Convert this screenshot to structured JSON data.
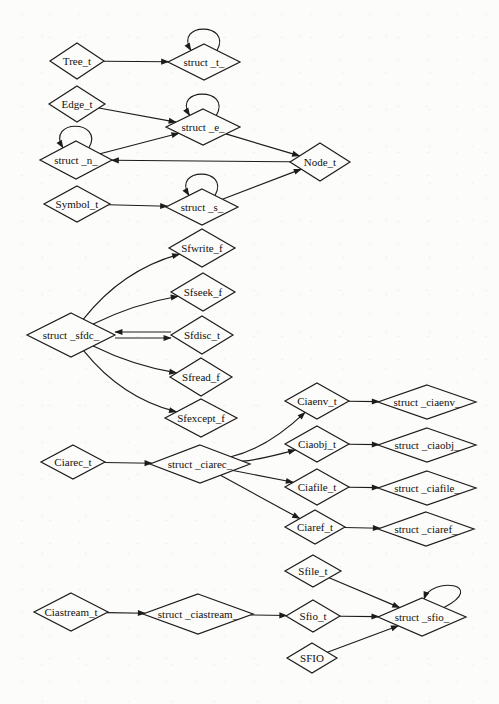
{
  "diagram": {
    "kind": "type-dependency-graph",
    "colors": {
      "stroke": "#1d1c1a",
      "text": "#12110f",
      "node_fill": "#fcfcfa",
      "background": "#fcfcfa"
    },
    "nodes": [
      {
        "id": "tree_t",
        "label": "Tree_t",
        "x": 77,
        "y": 61,
        "hw": 27,
        "hh": 18,
        "loop": ""
      },
      {
        "id": "struct_t",
        "label": "struct _t_",
        "x": 204,
        "y": 62,
        "hw": 36,
        "hh": 18,
        "loop": "top"
      },
      {
        "id": "edge_t",
        "label": "Edge_t",
        "x": 77,
        "y": 104,
        "hw": 28,
        "hh": 18,
        "loop": ""
      },
      {
        "id": "struct_e",
        "label": "struct _e_",
        "x": 203,
        "y": 127,
        "hw": 37,
        "hh": 18,
        "loop": "top"
      },
      {
        "id": "struct_n",
        "label": "struct _n_",
        "x": 76,
        "y": 160,
        "hw": 36,
        "hh": 19,
        "loop": "top"
      },
      {
        "id": "node_t",
        "label": "Node_t",
        "x": 320,
        "y": 162,
        "hw": 30,
        "hh": 19,
        "loop": ""
      },
      {
        "id": "symbol_t",
        "label": "Symbol_t",
        "x": 77,
        "y": 204,
        "hw": 33,
        "hh": 18,
        "loop": ""
      },
      {
        "id": "struct_s",
        "label": "struct _s_",
        "x": 202,
        "y": 207,
        "hw": 36,
        "hh": 18,
        "loop": "top"
      },
      {
        "id": "struct_sfdc",
        "label": "struct _sfdc_",
        "x": 71,
        "y": 335,
        "hw": 44,
        "hh": 22,
        "loop": ""
      },
      {
        "id": "sfwrite_f",
        "label": "Sfwrite_f",
        "x": 202,
        "y": 248,
        "hw": 33,
        "hh": 19,
        "loop": ""
      },
      {
        "id": "sfseek_f",
        "label": "Sfseek_f",
        "x": 203,
        "y": 292,
        "hw": 32,
        "hh": 19,
        "loop": ""
      },
      {
        "id": "sfdisc_t",
        "label": "Sfdisc_t",
        "x": 202,
        "y": 335,
        "hw": 31,
        "hh": 19,
        "loop": ""
      },
      {
        "id": "sfread_f",
        "label": "Sfread_f",
        "x": 201,
        "y": 377,
        "hw": 31,
        "hh": 19,
        "loop": ""
      },
      {
        "id": "sfexcept_f",
        "label": "Sfexcept_f",
        "x": 201,
        "y": 418,
        "hw": 36,
        "hh": 19,
        "loop": ""
      },
      {
        "id": "ciarec_t",
        "label": "Ciarec_t",
        "x": 73,
        "y": 462,
        "hw": 32,
        "hh": 17,
        "loop": ""
      },
      {
        "id": "struct_ciarec",
        "label": "struct _ciarec_",
        "x": 200,
        "y": 464,
        "hw": 50,
        "hh": 19,
        "loop": ""
      },
      {
        "id": "ciaenv_t",
        "label": "Ciaenv_t",
        "x": 317,
        "y": 401,
        "hw": 32,
        "hh": 18,
        "loop": ""
      },
      {
        "id": "struct_ciaenv",
        "label": "struct _ciaenv_",
        "x": 427,
        "y": 402,
        "hw": 49,
        "hh": 17,
        "loop": ""
      },
      {
        "id": "ciaobj_t",
        "label": "Ciaobj_t",
        "x": 317,
        "y": 444,
        "hw": 32,
        "hh": 18,
        "loop": ""
      },
      {
        "id": "struct_ciaobj",
        "label": "struct _ciaobj_",
        "x": 427,
        "y": 445,
        "hw": 49,
        "hh": 17,
        "loop": ""
      },
      {
        "id": "ciafile_t",
        "label": "Ciafile_t",
        "x": 317,
        "y": 487,
        "hw": 32,
        "hh": 18,
        "loop": ""
      },
      {
        "id": "struct_ciafile",
        "label": "struct _ciafile_",
        "x": 427,
        "y": 488,
        "hw": 49,
        "hh": 17,
        "loop": ""
      },
      {
        "id": "ciaref_t",
        "label": "Ciaref_t",
        "x": 315,
        "y": 527,
        "hw": 30,
        "hh": 17,
        "loop": ""
      },
      {
        "id": "struct_ciaref",
        "label": "struct _ciaref_",
        "x": 426,
        "y": 529,
        "hw": 48,
        "hh": 17,
        "loop": ""
      },
      {
        "id": "ciastream_t",
        "label": "Ciastream_t",
        "x": 71,
        "y": 612,
        "hw": 37,
        "hh": 19,
        "loop": ""
      },
      {
        "id": "struct_ciastream",
        "label": "struct _ciastream_",
        "x": 198,
        "y": 614,
        "hw": 55,
        "hh": 20,
        "loop": ""
      },
      {
        "id": "sfile_t",
        "label": "Sfile_t",
        "x": 313,
        "y": 571,
        "hw": 28,
        "hh": 16,
        "loop": ""
      },
      {
        "id": "sfio_t",
        "label": "Sfio_t",
        "x": 313,
        "y": 616,
        "hw": 27,
        "hh": 16,
        "loop": ""
      },
      {
        "id": "sfio",
        "label": "SFIO",
        "x": 312,
        "y": 658,
        "hw": 25,
        "hh": 15,
        "loop": ""
      },
      {
        "id": "struct_sfio",
        "label": "struct _sfio_",
        "x": 422,
        "y": 617,
        "hw": 44,
        "hh": 19,
        "loop": "topright"
      }
    ],
    "edges": [
      {
        "from": "tree_t",
        "to": "struct_t",
        "bend": 0,
        "shift_y": 0
      },
      {
        "from": "edge_t",
        "to": "struct_e",
        "bend": 0,
        "shift_y": 0
      },
      {
        "from": "struct_n",
        "to": "struct_e",
        "bend": 0,
        "shift_y": 0
      },
      {
        "from": "struct_e",
        "to": "node_t",
        "bend": 0,
        "shift_y": 0
      },
      {
        "from": "node_t",
        "to": "struct_n",
        "bend": 0,
        "shift_y": 0
      },
      {
        "from": "symbol_t",
        "to": "struct_s",
        "bend": 0,
        "shift_y": 0
      },
      {
        "from": "struct_s",
        "to": "node_t",
        "bend": 0,
        "shift_y": 0
      },
      {
        "from": "struct_sfdc",
        "to": "sfwrite_f",
        "bend": -26,
        "shift_y": 0
      },
      {
        "from": "struct_sfdc",
        "to": "sfseek_f",
        "bend": -10,
        "shift_y": 0
      },
      {
        "from": "struct_sfdc",
        "to": "sfdisc_t",
        "bend": 0,
        "shift_y": 3
      },
      {
        "from": "sfdisc_t",
        "to": "struct_sfdc",
        "bend": 0,
        "shift_y": -3
      },
      {
        "from": "struct_sfdc",
        "to": "sfread_f",
        "bend": 10,
        "shift_y": 0
      },
      {
        "from": "struct_sfdc",
        "to": "sfexcept_f",
        "bend": 26,
        "shift_y": 0
      },
      {
        "from": "ciarec_t",
        "to": "struct_ciarec",
        "bend": 0,
        "shift_y": 0
      },
      {
        "from": "struct_ciarec",
        "to": "ciaenv_t",
        "bend": 18,
        "shift_y": 0
      },
      {
        "from": "struct_ciarec",
        "to": "ciaobj_t",
        "bend": 6,
        "shift_y": 0
      },
      {
        "from": "struct_ciarec",
        "to": "ciafile_t",
        "bend": 0,
        "shift_y": 0
      },
      {
        "from": "struct_ciarec",
        "to": "ciaref_t",
        "bend": 0,
        "shift_y": 0
      },
      {
        "from": "ciaenv_t",
        "to": "struct_ciaenv",
        "bend": 0,
        "shift_y": 0
      },
      {
        "from": "ciaobj_t",
        "to": "struct_ciaobj",
        "bend": 0,
        "shift_y": 0
      },
      {
        "from": "ciafile_t",
        "to": "struct_ciafile",
        "bend": 0,
        "shift_y": 0
      },
      {
        "from": "ciaref_t",
        "to": "struct_ciaref",
        "bend": 0,
        "shift_y": 0
      },
      {
        "from": "ciastream_t",
        "to": "struct_ciastream",
        "bend": 0,
        "shift_y": 0
      },
      {
        "from": "struct_ciastream",
        "to": "sfio_t",
        "bend": 0,
        "shift_y": 0
      },
      {
        "from": "sfio_t",
        "to": "struct_sfio",
        "bend": 0,
        "shift_y": 0
      },
      {
        "from": "sfile_t",
        "to": "struct_sfio",
        "bend": 0,
        "shift_y": 0
      },
      {
        "from": "sfio",
        "to": "struct_sfio",
        "bend": 0,
        "shift_y": 0
      }
    ]
  }
}
